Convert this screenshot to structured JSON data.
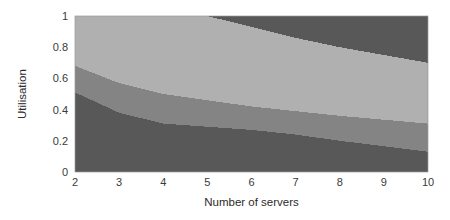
{
  "chart_data": {
    "type": "area",
    "title": "",
    "xlabel": "Number of servers",
    "ylabel": "Utilisation",
    "xlim": [
      2,
      10
    ],
    "ylim": [
      0,
      1
    ],
    "grid": false,
    "legend": "none",
    "xticks": [
      "2",
      "3",
      "4",
      "5",
      "6",
      "7",
      "8",
      "9",
      "10"
    ],
    "xtick_values": [
      2,
      3,
      4,
      5,
      6,
      7,
      8,
      9,
      10
    ],
    "yticks": [
      "0",
      "0.2",
      "0.4",
      "0.6",
      "0.8",
      "1"
    ],
    "ytick_values": [
      0,
      0.2,
      0.4,
      0.6,
      0.8,
      1
    ],
    "x": [
      2,
      3,
      4,
      5,
      6,
      7,
      8,
      9,
      10
    ],
    "boundaries": {
      "top_band_lower": [
        1.0,
        1.0,
        1.0,
        1.0,
        0.93,
        0.86,
        0.8,
        0.75,
        0.7
      ],
      "light_medium": [
        0.68,
        0.57,
        0.5,
        0.46,
        0.42,
        0.39,
        0.36,
        0.335,
        0.31
      ],
      "medium_dark": [
        0.51,
        0.38,
        0.31,
        0.29,
        0.27,
        0.24,
        0.2,
        0.165,
        0.13
      ]
    },
    "series": [
      {
        "name": "upper-dark-region",
        "color": "#585858",
        "upper": [
          1.0,
          1.0,
          1.0,
          1.0,
          1.0,
          1.0,
          1.0,
          1.0,
          1.0
        ],
        "lower": [
          1.0,
          1.0,
          1.0,
          1.0,
          0.93,
          0.86,
          0.8,
          0.75,
          0.7
        ]
      },
      {
        "name": "light-region",
        "color": "#b0b0b0",
        "upper": [
          1.0,
          1.0,
          1.0,
          1.0,
          0.93,
          0.86,
          0.8,
          0.75,
          0.7
        ],
        "lower": [
          0.68,
          0.57,
          0.5,
          0.46,
          0.42,
          0.39,
          0.36,
          0.335,
          0.31
        ]
      },
      {
        "name": "medium-region",
        "color": "#848484",
        "upper": [
          0.68,
          0.57,
          0.5,
          0.46,
          0.42,
          0.39,
          0.36,
          0.335,
          0.31
        ],
        "lower": [
          0.51,
          0.38,
          0.31,
          0.29,
          0.27,
          0.24,
          0.2,
          0.165,
          0.13
        ]
      },
      {
        "name": "lower-dark-region",
        "color": "#585858",
        "upper": [
          0.51,
          0.38,
          0.31,
          0.29,
          0.27,
          0.24,
          0.2,
          0.165,
          0.13
        ],
        "lower": [
          0.0,
          0.0,
          0.0,
          0.0,
          0.0,
          0.0,
          0.0,
          0.0,
          0.0
        ]
      }
    ],
    "colors": {
      "dark": "#585858",
      "medium": "#848484",
      "light": "#b0b0b0",
      "frame": "#9a9a9a",
      "text": "#2b2b2b",
      "background": "#ffffff"
    },
    "plot_area": {
      "left": 75,
      "top": 16,
      "right": 428,
      "bottom": 172
    }
  }
}
